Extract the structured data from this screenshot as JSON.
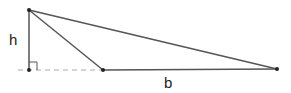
{
  "diagram": {
    "labels": {
      "height": "h",
      "base": "b"
    },
    "points": {
      "apex": [
        29,
        10
      ],
      "foot": [
        29,
        70
      ],
      "base_left": [
        103,
        70
      ],
      "base_right": [
        277,
        69
      ]
    },
    "colors": {
      "line": "#555555",
      "dashed": "#aaaaaa",
      "point": "#222222"
    }
  }
}
